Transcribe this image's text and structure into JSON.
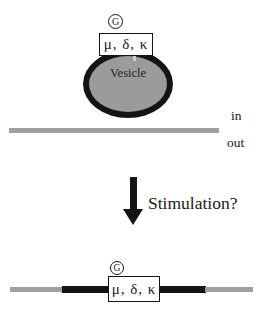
{
  "figure": {
    "top_panel": {
      "g_protein": "G",
      "receptors": "μ, δ, κ",
      "vesicle": "Vesicle",
      "membrane_in": "in",
      "membrane_out": "out"
    },
    "transition": {
      "label": "Stimulation?",
      "arrow_icon": "down-arrow"
    },
    "bottom_panel": {
      "g_protein": "G",
      "receptors": "μ, δ, κ"
    },
    "colors": {
      "background": "#ffffff",
      "ink": "#141414",
      "membrane_gray": "#a0a0a0",
      "vesicle_fill": "#9b9b9b",
      "box_background": "#ffffff"
    }
  }
}
